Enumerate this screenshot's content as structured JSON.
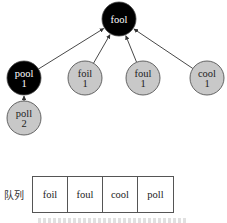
{
  "diagram": {
    "type": "tree-with-queue",
    "colors": {
      "visited_fill": "#000000",
      "visited_text": "#ffffff",
      "pending_fill": "#c8c8c8",
      "pending_text": "#222222",
      "edge": "#333333"
    },
    "nodes": [
      {
        "id": "fool",
        "word": "fool",
        "level": "",
        "state": "visited",
        "x": 119,
        "y": 19
      },
      {
        "id": "pool",
        "word": "pool",
        "level": "1",
        "state": "visited",
        "x": 24,
        "y": 78
      },
      {
        "id": "foil",
        "word": "foil",
        "level": "1",
        "state": "pending",
        "x": 85,
        "y": 78
      },
      {
        "id": "foul",
        "word": "foul",
        "level": "1",
        "state": "pending",
        "x": 143,
        "y": 78
      },
      {
        "id": "cool",
        "word": "cool",
        "level": "1",
        "state": "pending",
        "x": 207,
        "y": 78
      },
      {
        "id": "poll",
        "word": "poll",
        "level": "2",
        "state": "pending",
        "x": 24,
        "y": 118
      }
    ],
    "edges": [
      {
        "from": "pool",
        "to": "fool"
      },
      {
        "from": "foil",
        "to": "fool"
      },
      {
        "from": "foul",
        "to": "fool"
      },
      {
        "from": "cool",
        "to": "fool"
      },
      {
        "from": "poll",
        "to": "pool"
      }
    ]
  },
  "queue": {
    "label": "队列",
    "items": [
      "foil",
      "foul",
      "cool",
      "poll"
    ]
  }
}
